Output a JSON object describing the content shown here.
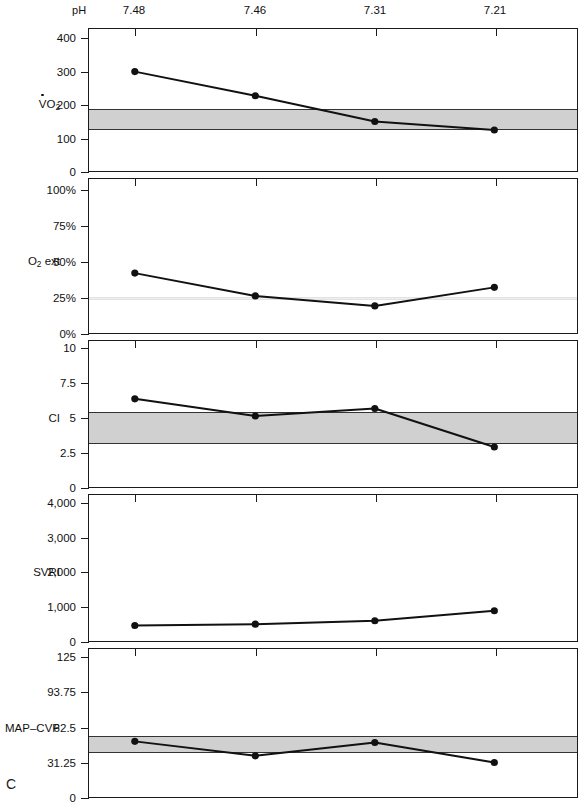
{
  "figure": {
    "panel_letter": "C",
    "x_axis": {
      "name": "pH",
      "label": "pH",
      "tick_labels": [
        "7.48",
        "7.46",
        "7.31",
        "7.21"
      ],
      "tick_positions_px": [
        134,
        255,
        375,
        495
      ]
    },
    "plot_left_px": 88,
    "plot_width_px": 490
  },
  "chart_data": [
    {
      "type": "line",
      "title": "VO2",
      "ylabel": "V̇O₂",
      "ylabel_parts": {
        "v": "V",
        "o": "O",
        "sub": "2"
      },
      "xlabel": "pH",
      "x": [
        "7.48",
        "7.46",
        "7.31",
        "7.21"
      ],
      "values": [
        301,
        228,
        150,
        124
      ],
      "ylim": [
        0,
        430
      ],
      "yticks": [
        0,
        100,
        200,
        300,
        400
      ],
      "ytick_labels": [
        "0",
        "100",
        "200",
        "300",
        "400"
      ],
      "normal_band": [
        128,
        190
      ],
      "band_style": "shaded",
      "grid": false,
      "panel_top_px": 28,
      "panel_height_px": 144
    },
    {
      "type": "line",
      "title": "O2 ext",
      "ylabel": "O₂ ext",
      "ylabel_parts": {
        "o": "O",
        "sub": "2",
        "rest": " ext"
      },
      "xlabel": "pH",
      "x": [
        "7.48",
        "7.46",
        "7.31",
        "7.21"
      ],
      "values": [
        42,
        26,
        19,
        32
      ],
      "ylim": [
        0,
        108
      ],
      "yticks": [
        0,
        25,
        50,
        75,
        100
      ],
      "ytick_labels": [
        "0%",
        "25%",
        "50%",
        "75%",
        "100%"
      ],
      "normal_band": [
        24,
        26
      ],
      "band_style": "faint",
      "grid": false,
      "panel_top_px": 178,
      "panel_height_px": 156
    },
    {
      "type": "line",
      "title": "CI",
      "ylabel": "CI",
      "xlabel": "pH",
      "x": [
        "7.48",
        "7.46",
        "7.31",
        "7.21"
      ],
      "values": [
        6.4,
        5.15,
        5.7,
        2.9
      ],
      "ylim": [
        0,
        10.6
      ],
      "yticks": [
        0,
        2.5,
        5,
        7.5,
        10
      ],
      "ytick_labels": [
        "0",
        "2.5",
        "5",
        "7.5",
        "10"
      ],
      "normal_band": [
        3.25,
        5.55
      ],
      "band_style": "shaded",
      "grid": false,
      "panel_top_px": 340,
      "panel_height_px": 148
    },
    {
      "type": "line",
      "title": "SVRI",
      "ylabel": "SVRI",
      "xlabel": "pH",
      "x": [
        "7.48",
        "7.46",
        "7.31",
        "7.21"
      ],
      "values": [
        450,
        490,
        590,
        880
      ],
      "ylim": [
        0,
        4250
      ],
      "yticks": [
        0,
        1000,
        2000,
        3000,
        4000
      ],
      "ytick_labels": [
        "0",
        "1,000",
        "2,000",
        "3,000",
        "4,000"
      ],
      "normal_band": null,
      "band_style": "none",
      "grid": false,
      "panel_top_px": 494,
      "panel_height_px": 148
    },
    {
      "type": "line",
      "title": "MAP-CVP",
      "ylabel": "MAP–CVP",
      "xlabel": "pH",
      "x": [
        "7.48",
        "7.46",
        "7.31",
        "7.21"
      ],
      "values": [
        50,
        37,
        49,
        31
      ],
      "ylim": [
        0,
        133
      ],
      "yticks": [
        0,
        31.25,
        62.5,
        93.75,
        125
      ],
      "ytick_labels": [
        "0",
        "31.25",
        "62.5",
        "93.75",
        "125"
      ],
      "normal_band": [
        41,
        56
      ],
      "band_style": "shaded",
      "grid": false,
      "panel_top_px": 648,
      "panel_height_px": 150
    }
  ],
  "style": {
    "line_color": "#111111",
    "marker_color": "#111111",
    "band_color": "#d0d0d0",
    "band_faint_color": "#efefef",
    "axis_color": "#1b1b1b",
    "background": "#ffffff"
  }
}
